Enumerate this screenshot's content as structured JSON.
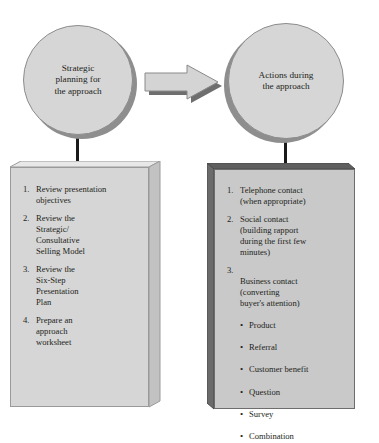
{
  "diagram": {
    "background_color": "#ffffff",
    "shape_fill": "#d6d6d6",
    "shape_fill_dark": "#c9c9c9",
    "shadow_color": "#8e8e8e",
    "outline_color": "#6d6d6d",
    "text_color": "#231f20",
    "nodes": {
      "circle_left": {
        "label": "Strategic\nplanning for\nthe approach"
      },
      "circle_right": {
        "label": "Actions during\nthe approach"
      }
    },
    "arrow": {
      "name": "right-arrow",
      "direction": "right",
      "from": "circle_left",
      "to": "circle_right"
    },
    "box_left": {
      "items": [
        {
          "number": "1.",
          "text": "Review presentation\nobjectives"
        },
        {
          "number": "2.",
          "text": "Review the\nStrategic/\nConsultative\nSelling Model"
        },
        {
          "number": "3.",
          "text": "Review the\nSix-Step\nPresentation\nPlan"
        },
        {
          "number": "4.",
          "text": "Prepare an\napproach\nworksheet"
        }
      ]
    },
    "box_right": {
      "items": [
        {
          "number": "1.",
          "text": "Telephone contact\n(when appropriate)"
        },
        {
          "number": "2.",
          "text": "Social contact\n(building rapport\nduring the first few\nminutes)"
        },
        {
          "number": "3.",
          "text": "Business contact\n(converting\nbuyer's attention)",
          "bullets": [
            "Product",
            "Referral",
            "Customer benefit",
            "Question",
            "Survey",
            "Combination"
          ]
        }
      ]
    }
  }
}
